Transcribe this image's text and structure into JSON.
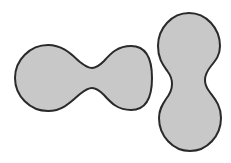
{
  "canvas": {
    "width": 231,
    "height": 163,
    "background_color": "#ffffff",
    "description": "Two gray peanut/dumbbell silhouettes on a plain white field"
  },
  "style": {
    "fill_color": "#c8c8c8",
    "stroke_color": "#2a2a2a",
    "stroke_width": 2
  },
  "shapes": [
    {
      "id": "left-peanut",
      "name": "horizontal-peanut-shape",
      "orientation": "horizontal",
      "fill_color": "#c8c8c8",
      "stroke_color": "#2a2a2a",
      "stroke_width": 2,
      "lobes": [
        {
          "cx": 48,
          "cy": 78,
          "r": 33
        },
        {
          "cx": 120,
          "cy": 78,
          "r": 32
        }
      ],
      "waist": {
        "x": 85,
        "half_height": 16
      },
      "bounds": {
        "x": 15,
        "y": 45,
        "width": 137,
        "height": 66
      },
      "path": "M 48 45 C 30 45 15 60 15 78 C 15 96 30 111 48 111 C 63 111 72 101 80 94 C 85 90 88 88 92 88 C 96 88 99 90 104 95 C 111 103 118 110 131 110 C 148 110 152 94 152 78 C 152 62 148 46 131 46 C 118 46 111 53 104 61 C 99 66 96 68 92 68 C 88 68 85 66 80 62 C 72 55 63 45 48 45 Z"
    },
    {
      "id": "right-peanut",
      "name": "vertical-peanut-shape",
      "orientation": "vertical",
      "fill_color": "#c8c8c8",
      "stroke_color": "#2a2a2a",
      "stroke_width": 2,
      "lobes": [
        {
          "cx": 189,
          "cy": 45,
          "r": 31
        },
        {
          "cx": 190,
          "cy": 117,
          "r": 31
        }
      ],
      "waist": {
        "y": 81,
        "half_width": 19
      },
      "bounds": {
        "x": 158,
        "y": 13,
        "width": 62,
        "height": 138
      },
      "path": "M 189 13 C 172 13 158 28 158 46 C 158 60 164 66 168 72 C 171 76 172 79 172 84 C 172 90 170 94 166 99 C 162 105 159 110 159 118 C 159 136 173 151 190 151 C 207 151 221 136 221 118 C 221 104 213 97 209 91 C 206 87 205 84 205 80 C 205 75 207 71 211 66 C 216 60 220 55 220 46 C 220 28 206 13 189 13 Z"
    }
  ]
}
